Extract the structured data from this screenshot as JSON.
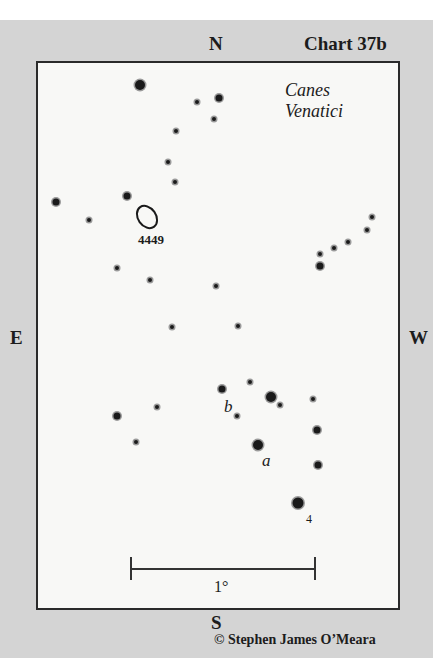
{
  "chart": {
    "title": "Chart 37b",
    "constellation_line1": "Canes",
    "constellation_line2": "Venatici",
    "copyright": "© Stephen James O’Meara",
    "colors": {
      "background": "#d4d4d4",
      "chart_area": "#f8f8f6",
      "ink": "#1a1a1a"
    }
  },
  "directions": {
    "north": "N",
    "south": "S",
    "east": "E",
    "west": "W"
  },
  "objects": {
    "galaxy_label": "4449",
    "star_label_a": "a",
    "star_label_b": "b",
    "star_label_4": "4"
  },
  "scale": {
    "label": "1°"
  },
  "stars": [
    {
      "x": 140,
      "y": 85,
      "size": "s2"
    },
    {
      "x": 197,
      "y": 102,
      "size": "s4"
    },
    {
      "x": 219,
      "y": 98,
      "size": "s3"
    },
    {
      "x": 214,
      "y": 119,
      "size": "s4"
    },
    {
      "x": 176,
      "y": 131,
      "size": "s4"
    },
    {
      "x": 168,
      "y": 162,
      "size": "s4"
    },
    {
      "x": 175,
      "y": 182,
      "size": "s4"
    },
    {
      "x": 127,
      "y": 196,
      "size": "s3"
    },
    {
      "x": 56,
      "y": 202,
      "size": "s3"
    },
    {
      "x": 89,
      "y": 220,
      "size": "s4"
    },
    {
      "x": 117,
      "y": 268,
      "size": "s4"
    },
    {
      "x": 150,
      "y": 280,
      "size": "s4"
    },
    {
      "x": 216,
      "y": 286,
      "size": "s4"
    },
    {
      "x": 372,
      "y": 217,
      "size": "s4"
    },
    {
      "x": 367,
      "y": 230,
      "size": "s4"
    },
    {
      "x": 348,
      "y": 242,
      "size": "s4"
    },
    {
      "x": 334,
      "y": 248,
      "size": "s4"
    },
    {
      "x": 320,
      "y": 254,
      "size": "s4"
    },
    {
      "x": 320,
      "y": 266,
      "size": "s3"
    },
    {
      "x": 172,
      "y": 327,
      "size": "s4"
    },
    {
      "x": 238,
      "y": 326,
      "size": "s4"
    },
    {
      "x": 222,
      "y": 389,
      "size": "s3"
    },
    {
      "x": 250,
      "y": 382,
      "size": "s4"
    },
    {
      "x": 271,
      "y": 397,
      "size": "s2"
    },
    {
      "x": 280,
      "y": 405,
      "size": "s4"
    },
    {
      "x": 313,
      "y": 399,
      "size": "s4"
    },
    {
      "x": 157,
      "y": 407,
      "size": "s4"
    },
    {
      "x": 237,
      "y": 416,
      "size": "s4"
    },
    {
      "x": 117,
      "y": 416,
      "size": "s3"
    },
    {
      "x": 136,
      "y": 442,
      "size": "s4"
    },
    {
      "x": 317,
      "y": 430,
      "size": "s3"
    },
    {
      "x": 258,
      "y": 445,
      "size": "s2"
    },
    {
      "x": 318,
      "y": 465,
      "size": "s3"
    },
    {
      "x": 298,
      "y": 503,
      "size": "s1"
    }
  ]
}
